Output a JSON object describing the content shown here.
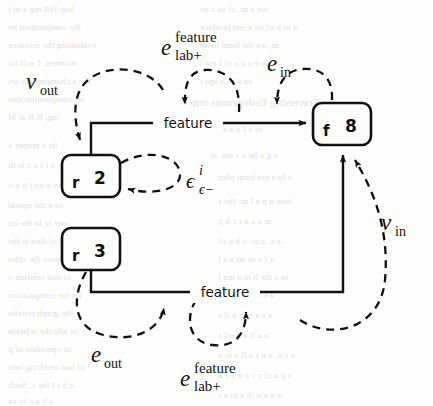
{
  "figure": {
    "background_color": "#fdfdfc",
    "stroke_color": "#111111",
    "nodes": [
      {
        "id": "r2",
        "kind_label": "r",
        "index_label": "2",
        "x": 62,
        "y": 155,
        "w": 58,
        "h": 42
      },
      {
        "id": "r3",
        "kind_label": "r",
        "index_label": "3",
        "x": 62,
        "y": 228,
        "w": 58,
        "h": 42
      },
      {
        "id": "f8",
        "kind_label": "f",
        "index_label": "8",
        "x": 313,
        "y": 103,
        "w": 58,
        "h": 42
      }
    ],
    "edge_labels": {
      "feature_top": "feature",
      "feature_bottom": "feature"
    },
    "annotations": [
      {
        "id": "v-out",
        "base": "v",
        "sup": "",
        "sub": "out",
        "style": "italic"
      },
      {
        "id": "e-lab-feature-top",
        "base": "e",
        "sup": "feature",
        "sub": "lab+",
        "style": "italic"
      },
      {
        "id": "e-in",
        "base": "e",
        "sup": "",
        "sub": "in",
        "style": "italic"
      },
      {
        "id": "epsilon-i",
        "base": "ϵ",
        "sup": "i",
        "sub": "ϵ−",
        "style": "italic"
      },
      {
        "id": "v-in",
        "base": "v",
        "sup": "",
        "sub": "in",
        "style": "italic"
      },
      {
        "id": "e-out",
        "base": "e",
        "sup": "",
        "sub": "out",
        "style": "italic"
      },
      {
        "id": "e-lab-feature-bottom",
        "base": "e",
        "sup": "feature",
        "sub": "lab+",
        "style": "italic"
      }
    ],
    "bleed_text": [
      {
        "t": "hap 160 mg a m j",
        "x": 8,
        "y": 4,
        "s": 9
      },
      {
        "t": "the computation be",
        "x": 8,
        "y": 22,
        "s": 9
      },
      {
        "t": "evaluating the resource",
        "x": 8,
        "y": 40,
        "s": 9
      },
      {
        "t": "moment. I will ho",
        "x": 8,
        "y": 58,
        "s": 9
      },
      {
        "t": "the a changing the set",
        "x": 8,
        "y": 76,
        "s": 9
      },
      {
        "t": "no-computation stas",
        "x": 8,
        "y": 94,
        "s": 9
      },
      {
        "t": "ing, R R at M",
        "x": 8,
        "y": 112,
        "s": 9
      },
      {
        "t": "tis a proper a",
        "x": 8,
        "y": 140,
        "s": 9
      },
      {
        "t": "a t f a c is th",
        "x": 8,
        "y": 160,
        "s": 9
      },
      {
        "t": "by a on t h u o",
        "x": 8,
        "y": 180,
        "s": 9
      },
      {
        "t": "re a the operal",
        "x": 8,
        "y": 200,
        "s": 9
      },
      {
        "t": "one to la the int",
        "x": 8,
        "y": 218,
        "s": 9
      },
      {
        "t": "to a of data is the",
        "x": 8,
        "y": 236,
        "s": 9
      },
      {
        "t": "wil relative the rules",
        "x": 8,
        "y": 254,
        "s": 9
      },
      {
        "t": "to mal relation o",
        "x": 8,
        "y": 272,
        "s": 9
      },
      {
        "t": "fin the computation",
        "x": 8,
        "y": 290,
        "s": 9
      },
      {
        "t": "the graph rewrite",
        "x": 8,
        "y": 308,
        "s": 9
      },
      {
        "t": "in whi the relation",
        "x": 8,
        "y": 326,
        "s": 9
      },
      {
        "t": "in operation of p",
        "x": 8,
        "y": 344,
        "s": 9
      },
      {
        "t": "of had resulting into",
        "x": 8,
        "y": 362,
        "s": 9
      },
      {
        "t": "o h t l the s. Such",
        "x": 8,
        "y": 380,
        "s": 9
      },
      {
        "t": "a b a c to ea",
        "x": 8,
        "y": 396,
        "s": 9
      },
      {
        "t": "we a m, of sa a so",
        "x": 200,
        "y": 4,
        "s": 9
      },
      {
        "t": "a m p of its e-net produce",
        "x": 200,
        "y": 22,
        "s": 9
      },
      {
        "t": "m, a s the band to an",
        "x": 200,
        "y": 40,
        "s": 9
      },
      {
        "t": "su e a a a of l ma i",
        "x": 200,
        "y": 58,
        "s": 9
      },
      {
        "t": "an s of a spa t",
        "x": 200,
        "y": 76,
        "s": 9
      },
      {
        "t": "Traversing Endogenous imp",
        "x": 190,
        "y": 96,
        "s": 11
      },
      {
        "t": "as a f a a a a s",
        "x": 210,
        "y": 124,
        "s": 9
      },
      {
        "t": "a g a ha a s ma, at",
        "x": 210,
        "y": 150,
        "s": 9
      },
      {
        "t": "a fe a ma from plan",
        "x": 218,
        "y": 172,
        "s": 9
      },
      {
        "t": "inan a n a l m, the s",
        "x": 218,
        "y": 196,
        "s": 9
      },
      {
        "t": "m a a a t c h p",
        "x": 218,
        "y": 216,
        "s": 9
      },
      {
        "t": "a s, a m. a h u of",
        "x": 218,
        "y": 236,
        "s": 9
      },
      {
        "t": "a f a m an a a l",
        "x": 218,
        "y": 254,
        "s": 9
      },
      {
        "t": "in a the h m a ma l",
        "x": 218,
        "y": 272,
        "s": 9
      },
      {
        "t": "a c a fa a f a m",
        "x": 218,
        "y": 290,
        "s": 9
      },
      {
        "t": "a s a m a n d a",
        "x": 218,
        "y": 310,
        "s": 9
      },
      {
        "t": "a a ll a a nd a",
        "x": 218,
        "y": 330,
        "s": 9
      },
      {
        "t": "a s n, a n f a ll a n, a",
        "x": 218,
        "y": 350,
        "s": 9
      },
      {
        "t": "s p a cl y r a n a c a",
        "x": 218,
        "y": 370,
        "s": 9
      },
      {
        "t": "a n a n th a m a r",
        "x": 218,
        "y": 390,
        "s": 9
      }
    ]
  }
}
